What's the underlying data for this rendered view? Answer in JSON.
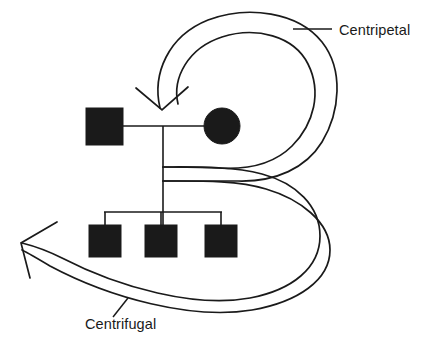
{
  "figure": {
    "background_color": "#ffffff",
    "ink_color": "#1a1a1a",
    "width": 431,
    "height": 348
  },
  "labels": [
    {
      "key": "centripetal",
      "text": "Centripetal",
      "x": 339,
      "y": 35,
      "anchor": "start",
      "leader": {
        "x1": 293,
        "y1": 29,
        "x2": 332,
        "y2": 29
      }
    },
    {
      "key": "centrifugal",
      "text": "Centrifugal",
      "x": 85,
      "y": 329,
      "anchor": "start",
      "leader": {
        "x1": 128,
        "y1": 298,
        "x2": 113,
        "y2": 317
      }
    }
  ],
  "pedigree": {
    "description": "Two-generation pedigree: father square, mother circle, three sons",
    "father": {
      "symbol": "square",
      "sex": "male",
      "filled": true,
      "x": 86,
      "y": 108,
      "size": 37
    },
    "mother": {
      "symbol": "circle",
      "sex": "female",
      "filled": true,
      "cx": 222,
      "cy": 126,
      "r": 18
    },
    "marriage_line": {
      "x1": 123,
      "y1": 126,
      "x2": 204,
      "y2": 126
    },
    "descent_line": {
      "x1": 163,
      "y1": 126,
      "x2": 163,
      "y2": 226
    },
    "sibship_bar": {
      "y": 212,
      "x1": 104,
      "x2": 222
    },
    "children": [
      {
        "symbol": "square",
        "sex": "male",
        "filled": true,
        "x": 89,
        "y": 225,
        "size": 32,
        "stem_x": 105
      },
      {
        "symbol": "square",
        "sex": "male",
        "filled": true,
        "x": 145,
        "y": 225,
        "size": 32,
        "stem_x": 161
      },
      {
        "symbol": "square",
        "sex": "male",
        "filled": true,
        "x": 205,
        "y": 225,
        "size": 32,
        "stem_x": 221
      }
    ]
  },
  "flows": {
    "centripetal": {
      "name": "centripetal-loop",
      "direction": "inward",
      "arrow": "down",
      "arrow_tip": {
        "x": 162,
        "y": 108
      },
      "note": "Double-stroked loop sweeping clockwise from the right, turning inward and arrowing down onto the parental couple"
    },
    "centrifugal": {
      "name": "centrifugal-loop",
      "direction": "outward",
      "arrow": "left",
      "arrow_tip": {
        "x": 21,
        "y": 243
      },
      "note": "Double-stroked band sweeping from the right side outward past the sibship to the left, arrowing away from the family"
    }
  }
}
